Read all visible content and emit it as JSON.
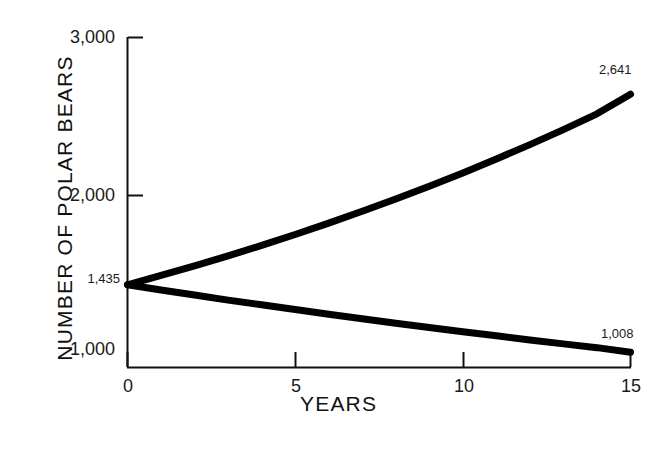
{
  "chart_data": {
    "type": "line",
    "title": "",
    "xlabel": "YEARS",
    "ylabel": "NUMBER OF POLAR BEARS",
    "xlim": [
      0,
      15
    ],
    "ylim": [
      912,
      3000
    ],
    "grid": false,
    "legend": null,
    "xticks": [
      {
        "value": 0,
        "label": "0"
      },
      {
        "value": 5,
        "label": "5"
      },
      {
        "value": 10,
        "label": "10"
      },
      {
        "value": 15,
        "label": "15"
      }
    ],
    "yticks": [
      {
        "value": 1000,
        "label": "1,000"
      },
      {
        "value": 2000,
        "label": "2,000"
      },
      {
        "value": 3000,
        "label": "3,000"
      }
    ],
    "annotations": [
      {
        "name": "start-value",
        "label": "1,435",
        "x": 0,
        "y": 1435
      },
      {
        "name": "growth-endpoint",
        "label": "2,641",
        "x": 15,
        "y": 2641
      },
      {
        "name": "decline-endpoint",
        "label": "1,008",
        "x": 15,
        "y": 1008
      }
    ],
    "series": [
      {
        "name": "increasing-projection",
        "color": "#000000",
        "x": [
          0,
          1,
          2,
          3,
          4,
          5,
          6,
          7,
          8,
          9,
          10,
          11,
          12,
          13,
          14,
          15
        ],
        "values": [
          1435,
          1494,
          1555,
          1618,
          1684,
          1753,
          1825,
          1900,
          1978,
          2059,
          2143,
          2231,
          2322,
          2417,
          2517,
          2641
        ]
      },
      {
        "name": "decreasing-projection",
        "color": "#000000",
        "x": [
          0,
          1,
          2,
          3,
          4,
          5,
          6,
          7,
          8,
          9,
          10,
          11,
          12,
          13,
          14,
          15
        ],
        "values": [
          1435,
          1402,
          1370,
          1338,
          1308,
          1278,
          1248,
          1220,
          1192,
          1164,
          1138,
          1112,
          1086,
          1061,
          1037,
          1008
        ]
      }
    ]
  },
  "axis": {
    "y_title": "NUMBER OF POLAR BEARS",
    "x_title": "YEARS"
  },
  "labels": {
    "y_3000": "3,000",
    "y_2000": "2,000",
    "y_1435": "1,435",
    "y_1000": "1,000",
    "x_0": "0",
    "x_5": "5",
    "x_10": "10",
    "x_15": "15",
    "point_2641": "2,641",
    "point_1008": "1,008"
  }
}
